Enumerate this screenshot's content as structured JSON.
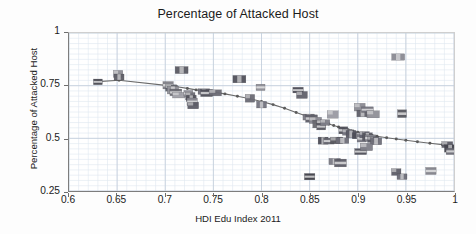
{
  "chart_data": {
    "type": "scatter",
    "title": "Percentage of Attacked Host",
    "xlabel": "HDI Edu Index 2011",
    "ylabel": "Percentage of Attacked Host",
    "xlim": [
      0.6,
      1.0
    ],
    "ylim": [
      0.25,
      1.0
    ],
    "xticks": [
      "0.6",
      "0.65",
      "0.7",
      "0.75",
      "0.8",
      "0.85",
      "0.9",
      "0.95",
      "1"
    ],
    "xtick_values": [
      0.6,
      0.65,
      0.7,
      0.75,
      0.8,
      0.85,
      0.9,
      0.95,
      1.0
    ],
    "yticks": [
      "0.25",
      "0.5",
      "0.75",
      "1"
    ],
    "ytick_values": [
      0.25,
      0.5,
      0.75,
      1.0
    ],
    "grid": true,
    "grid_minor_x_step": 0.01,
    "grid_minor_y_step": 0.025,
    "grid_color": "#dfe7f0",
    "grid_major_color": "#c3cedb",
    "legend": "none",
    "marker_style": "country-flag-image",
    "marker_size": [
      11,
      7
    ],
    "trend_line": {
      "name": "fitted trend",
      "color": "#6b6b6b",
      "width": 1.1,
      "node_color": "#5a5a5a",
      "x": [
        0.63,
        0.652,
        0.703,
        0.712,
        0.723,
        0.732,
        0.742,
        0.752,
        0.762,
        0.775,
        0.788,
        0.8,
        0.812,
        0.824,
        0.836,
        0.845,
        0.852,
        0.858,
        0.864,
        0.87,
        0.875,
        0.88,
        0.885,
        0.89,
        0.895,
        0.9,
        0.905,
        0.91,
        0.915,
        0.92,
        0.93,
        0.94,
        0.95,
        0.962,
        0.975,
        0.988,
        0.998
      ],
      "y": [
        0.769,
        0.776,
        0.75,
        0.745,
        0.737,
        0.73,
        0.724,
        0.718,
        0.711,
        0.7,
        0.688,
        0.675,
        0.66,
        0.643,
        0.623,
        0.608,
        0.596,
        0.586,
        0.577,
        0.568,
        0.561,
        0.554,
        0.547,
        0.541,
        0.535,
        0.529,
        0.524,
        0.519,
        0.514,
        0.51,
        0.503,
        0.497,
        0.491,
        0.484,
        0.477,
        0.47,
        0.464
      ]
    },
    "series": [
      {
        "name": "countries",
        "points": [
          {
            "x": 0.63,
            "y": 0.768,
            "c": "#4a4a52"
          },
          {
            "x": 0.651,
            "y": 0.806,
            "c": "#8d8d95"
          },
          {
            "x": 0.652,
            "y": 0.791,
            "c": "#5f5f67"
          },
          {
            "x": 0.703,
            "y": 0.752,
            "c": "#7e7e86"
          },
          {
            "x": 0.706,
            "y": 0.739,
            "c": "#5d6068"
          },
          {
            "x": 0.708,
            "y": 0.729,
            "c": "#93939b"
          },
          {
            "x": 0.711,
            "y": 0.718,
            "c": "#6b6b73"
          },
          {
            "x": 0.714,
            "y": 0.705,
            "c": "#a0a0a8"
          },
          {
            "x": 0.717,
            "y": 0.824,
            "c": "#5a5a62"
          },
          {
            "x": 0.724,
            "y": 0.713,
            "c": "#8a8a92"
          },
          {
            "x": 0.726,
            "y": 0.7,
            "c": "#6e6e76"
          },
          {
            "x": 0.727,
            "y": 0.69,
            "c": "#565660"
          },
          {
            "x": 0.728,
            "y": 0.673,
            "c": "#8a8a92"
          },
          {
            "x": 0.729,
            "y": 0.656,
            "c": "#5c5c66"
          },
          {
            "x": 0.74,
            "y": 0.722,
            "c": "#70707a"
          },
          {
            "x": 0.743,
            "y": 0.715,
            "c": "#4e4e58"
          },
          {
            "x": 0.752,
            "y": 0.716,
            "c": "#6a6a74"
          },
          {
            "x": 0.777,
            "y": 0.781,
            "c": "#51515b"
          },
          {
            "x": 0.799,
            "y": 0.742,
            "c": "#8e8e96"
          },
          {
            "x": 0.788,
            "y": 0.69,
            "c": "#6a6a74"
          },
          {
            "x": 0.8,
            "y": 0.66,
            "c": "#74747e"
          },
          {
            "x": 0.838,
            "y": 0.729,
            "c": "#4b4b55"
          },
          {
            "x": 0.842,
            "y": 0.706,
            "c": "#61616b"
          },
          {
            "x": 0.849,
            "y": 0.601,
            "c": "#7a7a84"
          },
          {
            "x": 0.852,
            "y": 0.594,
            "c": "#5e5e68"
          },
          {
            "x": 0.856,
            "y": 0.585,
            "c": "#8a8a92"
          },
          {
            "x": 0.86,
            "y": 0.568,
            "c": "#68686f"
          },
          {
            "x": 0.862,
            "y": 0.556,
            "c": "#55555f"
          },
          {
            "x": 0.866,
            "y": 0.575,
            "c": "#7e7e88"
          },
          {
            "x": 0.864,
            "y": 0.489,
            "c": "#4c4c56"
          },
          {
            "x": 0.87,
            "y": 0.487,
            "c": "#6a6a74"
          },
          {
            "x": 0.874,
            "y": 0.613,
            "c": "#9a9aa2"
          },
          {
            "x": 0.876,
            "y": 0.39,
            "c": "#7b7b85"
          },
          {
            "x": 0.882,
            "y": 0.383,
            "c": "#5c5c66"
          },
          {
            "x": 0.878,
            "y": 0.49,
            "c": "#58585f"
          },
          {
            "x": 0.884,
            "y": 0.489,
            "c": "#6e6e78"
          },
          {
            "x": 0.885,
            "y": 0.538,
            "c": "#4f4f59"
          },
          {
            "x": 0.889,
            "y": 0.529,
            "c": "#75757f"
          },
          {
            "x": 0.893,
            "y": 0.52,
            "c": "#5a5a64"
          },
          {
            "x": 0.85,
            "y": 0.318,
            "c": "#3f3f48"
          },
          {
            "x": 0.902,
            "y": 0.648,
            "c": "#8b8b93"
          },
          {
            "x": 0.905,
            "y": 0.618,
            "c": "#5f5f69"
          },
          {
            "x": 0.91,
            "y": 0.636,
            "c": "#73737d"
          },
          {
            "x": 0.916,
            "y": 0.614,
            "c": "#8f8f97"
          },
          {
            "x": 0.901,
            "y": 0.512,
            "c": "#4d4d57"
          },
          {
            "x": 0.904,
            "y": 0.5,
            "c": "#7a7a84"
          },
          {
            "x": 0.907,
            "y": 0.517,
            "c": "#636370"
          },
          {
            "x": 0.91,
            "y": 0.508,
            "c": "#56565f"
          },
          {
            "x": 0.913,
            "y": 0.501,
            "c": "#84848c"
          },
          {
            "x": 0.916,
            "y": 0.494,
            "c": "#5b5b65"
          },
          {
            "x": 0.919,
            "y": 0.486,
            "c": "#6f6f79"
          },
          {
            "x": 0.903,
            "y": 0.437,
            "c": "#50505a"
          },
          {
            "x": 0.909,
            "y": 0.459,
            "c": "#7d7d87"
          },
          {
            "x": 0.942,
            "y": 0.886,
            "c": "#8a8a92"
          },
          {
            "x": 0.946,
            "y": 0.617,
            "c": "#57575f"
          },
          {
            "x": 0.94,
            "y": 0.34,
            "c": "#5e5e68"
          },
          {
            "x": 0.946,
            "y": 0.318,
            "c": "#6c6c76"
          },
          {
            "x": 0.976,
            "y": 0.345,
            "c": "#82828a"
          },
          {
            "x": 0.993,
            "y": 0.47,
            "c": "#5a5a64"
          },
          {
            "x": 0.996,
            "y": 0.452,
            "c": "#44444e"
          },
          {
            "x": 0.998,
            "y": 0.438,
            "c": "#6b6b75"
          }
        ]
      }
    ]
  }
}
